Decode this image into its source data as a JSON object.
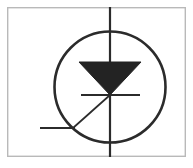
{
  "figure": {
    "title": "Photodiode schematic symbol",
    "background_color": "#ffffff",
    "line_color": "#2b2b2b",
    "fill_color": "#232323",
    "border_color": "#b9b9b9",
    "canvas": {
      "width": 193,
      "height": 168
    }
  },
  "chart_data": {
    "type": "diagram",
    "title": "Photodiode schematic symbol",
    "units": "pixels",
    "view_box": [
      0,
      0,
      193,
      168
    ],
    "elements": [
      {
        "name": "frame",
        "label": "Outer frame border",
        "shape": "rect",
        "x": 7,
        "y": 7,
        "width": 179,
        "height": 150,
        "stroke": "#b9b9b9",
        "stroke_width": 1.4,
        "fill": "none"
      },
      {
        "name": "envelope-circle",
        "label": "Device envelope circle",
        "shape": "circle",
        "cx": 110,
        "cy": 87,
        "r": 55.5,
        "stroke": "#2b2b2b",
        "stroke_width": 2.6,
        "fill": "none"
      },
      {
        "name": "anode-lead",
        "label": "Vertical lead through symbol",
        "shape": "line",
        "x1": 110,
        "y1": 7,
        "x2": 110,
        "y2": 157,
        "stroke": "#2b2b2b",
        "stroke_width": 2.2
      },
      {
        "name": "diode-triangle",
        "label": "Filled diode triangle pointing down",
        "shape": "polygon",
        "points": [
          [
            79,
            62
          ],
          [
            141,
            62
          ],
          [
            110,
            95
          ]
        ],
        "fill": "#232323",
        "stroke": "#232323",
        "stroke_width": 1
      },
      {
        "name": "cathode-bar",
        "label": "Cathode bar",
        "shape": "line",
        "x1": 81,
        "y1": 95,
        "x2": 140,
        "y2": 95,
        "stroke": "#2b2b2b",
        "stroke_width": 2.2
      },
      {
        "name": "diagonal-lead",
        "label": "Diagonal lead from junction to lower left",
        "shape": "line",
        "x1": 110,
        "y1": 95,
        "x2": 73,
        "y2": 128,
        "stroke": "#2b2b2b",
        "stroke_width": 1.7
      },
      {
        "name": "horizontal-lead",
        "label": "Horizontal lead at lower left",
        "shape": "line",
        "x1": 40,
        "y1": 128,
        "x2": 75,
        "y2": 128,
        "stroke": "#2b2b2b",
        "stroke_width": 2.2
      }
    ],
    "annotations": [],
    "legend": []
  }
}
